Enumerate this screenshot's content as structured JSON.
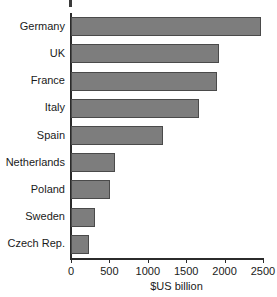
{
  "chart_data": {
    "type": "bar",
    "orientation": "horizontal",
    "title": "",
    "xlabel": "$US billion",
    "ylabel": "",
    "categories": [
      "Germany",
      "UK",
      "France",
      "Italy",
      "Spain",
      "Netherlands",
      "Poland",
      "Sweden",
      "Czech Rep."
    ],
    "values": [
      2470,
      1930,
      1900,
      1670,
      1200,
      570,
      510,
      310,
      240
    ],
    "xlim": [
      0,
      2500
    ],
    "xticks": [
      0,
      500,
      1000,
      1500,
      2000,
      2500
    ],
    "xtick_labels": [
      "0",
      "500",
      "1000",
      "1500",
      "2000",
      "2500"
    ],
    "grid": false,
    "legend": null,
    "bar_color": "#7d7d7d",
    "bar_border_color": "#4a4a4a",
    "axis_color": "#2b2b2b",
    "text_color": "#1a1a1a",
    "background": "#ffffff"
  }
}
